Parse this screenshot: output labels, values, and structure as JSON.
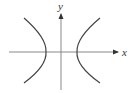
{
  "diagram": {
    "type": "hyperbola",
    "title": "",
    "axes": {
      "x_label": "x",
      "y_label": "y",
      "color": "#888888"
    },
    "curve": {
      "color": "#444444",
      "branches": [
        "left",
        "right"
      ],
      "orientation": "horizontal transverse axis",
      "opens": "left and right"
    }
  }
}
